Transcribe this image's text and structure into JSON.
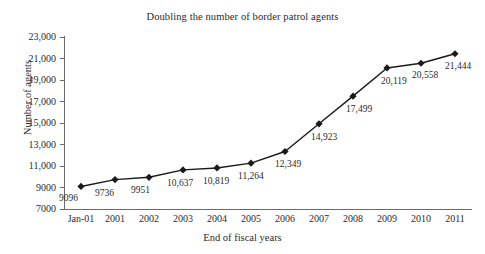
{
  "chart_data": {
    "type": "line",
    "title": "Doubling the number of border patrol agents",
    "xlabel": "End of fiscal years",
    "ylabel": "Number of agents",
    "categories": [
      "Jan-01",
      "2001",
      "2002",
      "2003",
      "2004",
      "2005",
      "2006",
      "2007",
      "2008",
      "2009",
      "2010",
      "2011"
    ],
    "values": [
      9096,
      9736,
      9951,
      10637,
      10819,
      11264,
      12349,
      14923,
      17499,
      20119,
      20558,
      21444
    ],
    "point_labels": [
      "9096",
      "9736",
      "9951",
      "10,637",
      "10,819",
      "11,264",
      "12,349",
      "14,923",
      "17,499",
      "20,119",
      "20,558",
      "21,444"
    ],
    "ylim": [
      7000,
      23000
    ],
    "yticks": [
      7000,
      9000,
      11000,
      13000,
      15000,
      17000,
      19000,
      21000,
      23000
    ],
    "ytick_labels": [
      "7000",
      "9000",
      "11,000",
      "13,000",
      "15,000",
      "17,000",
      "19,000",
      "21,000",
      "23,000"
    ],
    "grid": false,
    "legend": "none",
    "series_color": "#1a1a1a",
    "marker": "diamond",
    "axis_color": "#6b6b6b"
  },
  "ghost_text": {
    "clipped_header": "cut-off text"
  }
}
